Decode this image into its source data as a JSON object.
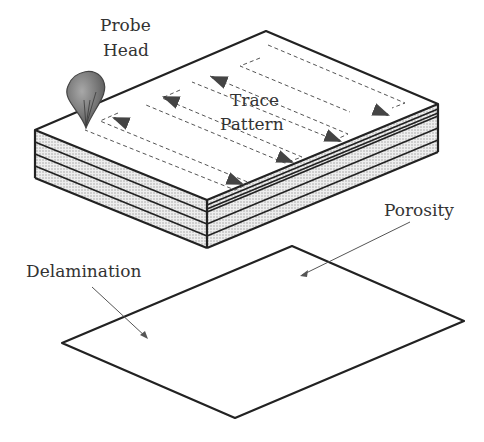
{
  "labels": {
    "probe_head_line1": "Probe",
    "probe_head_line2": "Head",
    "trace_pattern_line1": "Trace",
    "trace_pattern_line2": "Pattern",
    "porosity": "Porosity",
    "delamination": "Delamination"
  },
  "colors": {
    "outline": "#222222",
    "layer_fill": "#e4e4e4",
    "plate_fill": "#dcdcdc",
    "probe_fill": "#7a7a7a",
    "defect": "#ffffff",
    "text": "#333333"
  },
  "composite": {
    "layer_count": 4,
    "trace_passes": 4
  }
}
